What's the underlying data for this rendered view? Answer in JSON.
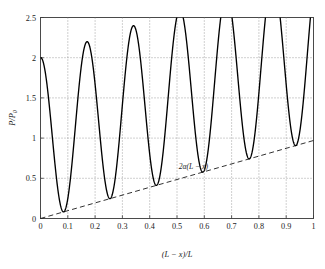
{
  "chart_data": {
    "type": "line",
    "title": "",
    "xlabel": "(L − x)/L",
    "ylabel": "P/P₀",
    "xlim": [
      0,
      1
    ],
    "ylim": [
      0,
      2.5
    ],
    "grid": true,
    "grid_style": "dotted",
    "legend": "none",
    "xticks": [
      "0",
      "0.1",
      "0.2",
      "0.3",
      "0.4",
      "0.5",
      "0.6",
      "0.7",
      "0.8",
      "0.9",
      "1"
    ],
    "xtick_values": [
      0,
      0.1,
      0.2,
      0.3,
      0.4,
      0.5,
      0.6,
      0.7,
      0.8,
      0.9,
      1
    ],
    "yticks": [
      "0",
      "0.5",
      "1",
      "1.5",
      "2",
      "2.5"
    ],
    "ytick_values": [
      0,
      0.5,
      1,
      1.5,
      2,
      2.5
    ],
    "series": [
      {
        "name": "P/P0",
        "style": "solid",
        "color": "#000000",
        "model": "baseline_plus_cosine",
        "description": "Oscillating standing-wave pressure ratio; minima ride the 2a(L-x) baseline, maxima grow slowly from 2.0 to about 2.16",
        "period": 0.17,
        "phase_x0": 0,
        "baseline_slope": 0.97,
        "amplitude_at_0": 1.0,
        "amplitude_growth": 0.1,
        "maxima_x": [
          0,
          0.165,
          0.335,
          0.505,
          0.675,
          0.845,
          1.0
        ],
        "maxima_y": [
          2.0,
          1.99,
          2.02,
          2.05,
          2.09,
          2.16,
          1.96
        ],
        "minima_x": [
          0.085,
          0.25,
          0.42,
          0.585,
          0.76,
          0.935
        ],
        "minima_y": [
          0.08,
          0.25,
          0.42,
          0.58,
          0.75,
          0.92
        ]
      },
      {
        "name": "2a(L-x)",
        "style": "dashed",
        "color": "#1c1c1c",
        "x": [
          0,
          1
        ],
        "values": [
          0,
          0.97
        ]
      }
    ],
    "annotations": [
      {
        "name": "baseline-label",
        "text_prefix": "2",
        "text_symbol": "α",
        "text_suffix": "(L − x)",
        "x": 0.56,
        "y": 0.62
      }
    ]
  },
  "axes": {
    "y_title_main": "P/P",
    "y_title_sub": "0",
    "x_title": "(L − x)/L"
  }
}
